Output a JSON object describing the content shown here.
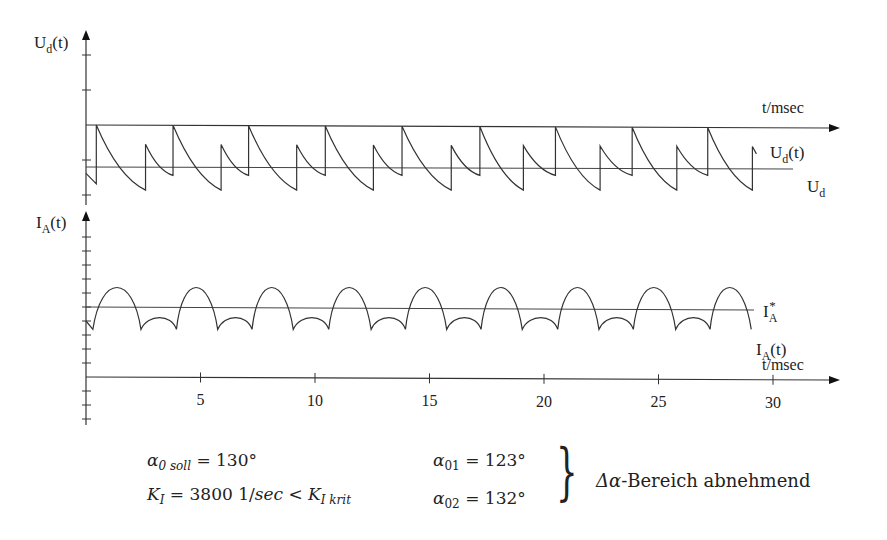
{
  "chart_data": [
    {
      "type": "line",
      "title": "",
      "ylabel": "U_d(t)",
      "ylabel_main": "U",
      "ylabel_sub": "d",
      "ylabel_suffix": "(t)",
      "xlabel": "t/msec",
      "xlim": [
        0,
        30
      ],
      "grid": false,
      "series": [
        {
          "name": "U_d(t)",
          "label_main": "U",
          "label_sub": "d",
          "label_suffix": "(t)",
          "description": "sawtooth-like rectifier voltage with alternating large and small pulses",
          "large_pulse_times_ms": [
            0.45,
            3.8,
            7.1,
            10.45,
            13.8,
            17.2,
            20.5,
            23.85,
            27.15
          ],
          "small_pulse_times_ms": [
            2.6,
            5.9,
            9.2,
            12.55,
            15.95,
            19.1,
            22.45,
            25.8,
            29.1
          ],
          "large_pulse_peak": 1.0,
          "small_pulse_peak": 0.55,
          "trough_after_large": -0.55,
          "trough_after_small": -0.2
        },
        {
          "name": "U_d (mean)",
          "label_main": "U",
          "label_sub": "d",
          "value": 0.0
        }
      ]
    },
    {
      "type": "line",
      "title": "",
      "ylabel": "I_A(t)",
      "ylabel_main": "I",
      "ylabel_sub": "A",
      "ylabel_suffix": "(t)",
      "xlabel": "t/msec",
      "xlim": [
        0,
        30
      ],
      "xticks": [
        5,
        10,
        15,
        20,
        25,
        30
      ],
      "xtick_labels": [
        "5",
        "10",
        "15",
        "20",
        "25",
        "30"
      ],
      "grid": false,
      "series": [
        {
          "name": "I_A(t)",
          "label_main": "I",
          "label_sub": "A",
          "label_suffix": "(t)",
          "description": "rectified current ripple: alternating large and small arches",
          "large_arch_centers_ms": [
            1.35,
            4.7,
            8.0,
            11.4,
            14.7,
            18.0,
            21.35,
            24.7,
            28.0
          ],
          "small_arch_centers_ms": [
            3.3,
            6.6,
            9.95,
            13.3,
            16.6,
            19.95,
            23.25,
            26.6
          ],
          "large_arch_peak": 1.4,
          "small_arch_peak": -0.75,
          "cusp_value": -1.6
        },
        {
          "name": "I_A* (reference)",
          "label_main": "I",
          "label_sub": "A",
          "label_sup": "*",
          "value": 0.0
        }
      ]
    }
  ],
  "parameters": {
    "alpha_soll": {
      "symbol": "α",
      "sub": "0 soll",
      "value": "= 130°"
    },
    "k_i": {
      "symbol": "K",
      "sub": "I",
      "value": "= 3800 1/",
      "unit": "sec",
      "cmp": " < ",
      "rhs": "K",
      "rhs_sub": "I krit"
    },
    "alpha_01": {
      "symbol": "α",
      "sub": "01",
      "value": "= 123°"
    },
    "alpha_02": {
      "symbol": "α",
      "sub": "02",
      "value": "= 132°"
    },
    "brace": "}",
    "conclusion_delta": "Δα",
    "conclusion_text": "-Bereich abnehmend"
  }
}
